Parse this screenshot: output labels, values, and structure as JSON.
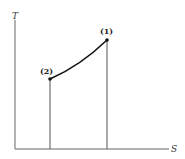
{
  "diagram": {
    "type": "T-s diagram",
    "axes": {
      "y_label": "T",
      "x_label": "S"
    },
    "points": [
      {
        "id": "1",
        "label": "(1)"
      },
      {
        "id": "2",
        "label": "(2)"
      }
    ],
    "colors": {
      "line": "#111111",
      "axis": "#555555",
      "background": "#ffffff"
    }
  }
}
